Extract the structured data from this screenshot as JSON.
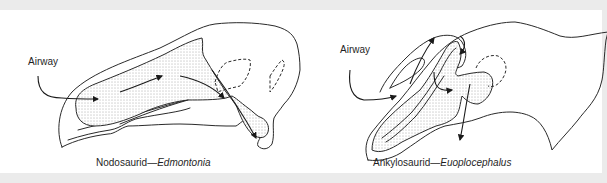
{
  "figure": {
    "background": "#ebebeb",
    "panel_color": "#ffffff",
    "line_color": "#2a2a2a"
  },
  "diagrams": [
    {
      "id": "nodosaurid",
      "airway_label": "Airway",
      "caption_group": "Nodosaurid",
      "caption_dash": "—",
      "caption_genus": "Edmontonia"
    },
    {
      "id": "ankylosaurid",
      "airway_label": "Airway",
      "caption_group": "Ankylosaurid",
      "caption_dash": "—",
      "caption_genus": "Euoplocephalus"
    }
  ]
}
